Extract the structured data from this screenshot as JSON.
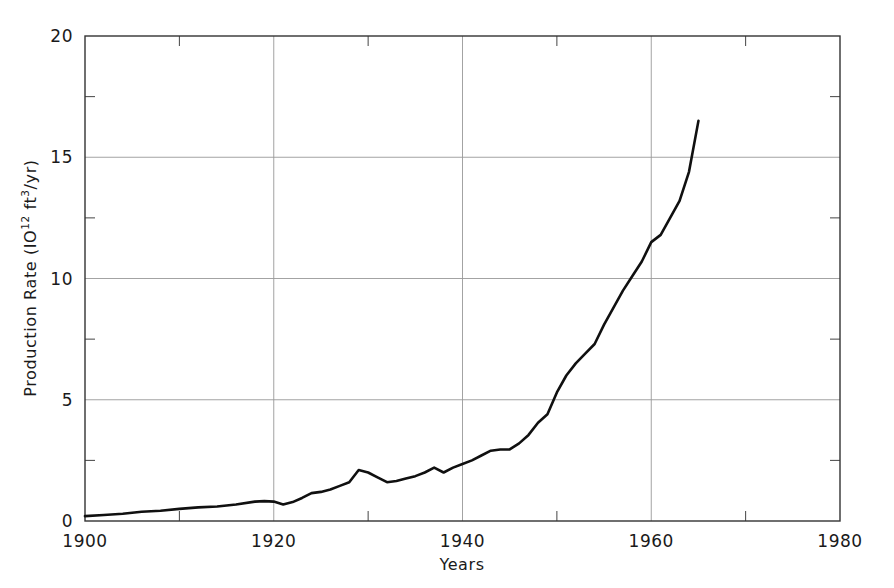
{
  "chart_data": {
    "type": "line",
    "title": "",
    "xlabel": "Years",
    "ylabel": "Production Rate (10¹² ft³/yr)",
    "ylabel_parts": {
      "prefix": "Production Rate (IO",
      "sup1": "12",
      "mid": " ft",
      "sup2": "3",
      "suffix": "/yr)"
    },
    "xlim": [
      1900,
      1980
    ],
    "ylim": [
      0,
      20
    ],
    "xticks": [
      1900,
      1920,
      1940,
      1960,
      1980
    ],
    "xtick_labels": [
      "1900",
      "1920",
      "1940",
      "1960",
      "1980"
    ],
    "xminorticks": [
      1910,
      1930,
      1950,
      1970
    ],
    "yticks": [
      0,
      5,
      10,
      15,
      20
    ],
    "ytick_labels": [
      "0",
      "5",
      "10",
      "15",
      "20"
    ],
    "yminorticks": [
      2.5,
      7.5,
      12.5,
      17.5
    ],
    "grid": true,
    "grid_color": "#999999",
    "line_color": "#101010",
    "line_width": 2.6,
    "legend": "none",
    "series": [
      {
        "name": "Natural gas production rate",
        "x": [
          1900,
          1902,
          1904,
          1906,
          1908,
          1910,
          1912,
          1914,
          1916,
          1918,
          1919,
          1920,
          1921,
          1922,
          1923,
          1924,
          1925,
          1926,
          1927,
          1928,
          1929,
          1930,
          1931,
          1932,
          1933,
          1934,
          1935,
          1936,
          1937,
          1938,
          1939,
          1940,
          1941,
          1942,
          1943,
          1944,
          1945,
          1946,
          1947,
          1948,
          1949,
          1950,
          1951,
          1952,
          1953,
          1954,
          1955,
          1956,
          1957,
          1958,
          1959,
          1960,
          1961,
          1962,
          1963,
          1964,
          1965
        ],
        "values": [
          0.2,
          0.25,
          0.3,
          0.38,
          0.42,
          0.5,
          0.56,
          0.6,
          0.68,
          0.8,
          0.82,
          0.8,
          0.68,
          0.78,
          0.95,
          1.15,
          1.2,
          1.3,
          1.45,
          1.6,
          2.1,
          2.0,
          1.8,
          1.6,
          1.65,
          1.75,
          1.85,
          2.0,
          2.2,
          2.0,
          2.2,
          2.35,
          2.5,
          2.7,
          2.9,
          2.95,
          2.95,
          3.2,
          3.55,
          4.05,
          4.4,
          5.3,
          6.0,
          6.5,
          6.9,
          7.3,
          8.1,
          8.8,
          9.5,
          10.1,
          10.7,
          11.5,
          11.8,
          12.5,
          13.2,
          14.4,
          16.5
        ]
      }
    ]
  },
  "annotations": {
    "x_axis_title": "Years"
  }
}
